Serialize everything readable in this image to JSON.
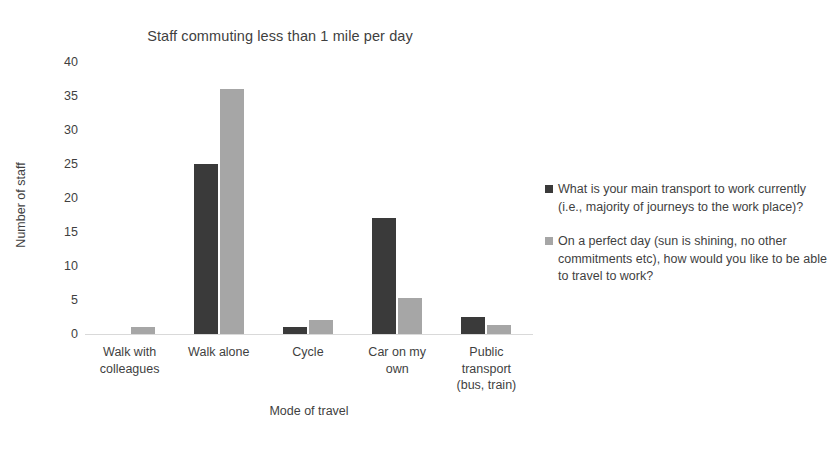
{
  "chart_data": {
    "type": "bar",
    "title": "Staff commuting less than 1 mile per day",
    "xlabel": "Mode of travel",
    "ylabel": "Number of staff",
    "categories": [
      "Walk with\ncolleagues",
      "Walk alone",
      "Cycle",
      "Car on my\nown",
      "Public\ntransport\n(bus, train)"
    ],
    "series": [
      {
        "name": "What is your main transport to work currently (i.e., majority of journeys to the work place)?",
        "color": "#3a3a3a",
        "values": [
          0,
          25,
          1,
          17,
          2.5
        ]
      },
      {
        "name": "On a perfect day (sun is shining, no other commitments etc), how would you like to be able to travel to work?",
        "color": "#a6a6a6",
        "values": [
          1,
          36,
          2,
          5.3,
          1.3
        ]
      }
    ],
    "ylim": [
      0,
      40
    ],
    "yticks": [
      0,
      5,
      10,
      15,
      20,
      25,
      30,
      35,
      40
    ],
    "grid": false,
    "legend_position": "right"
  }
}
